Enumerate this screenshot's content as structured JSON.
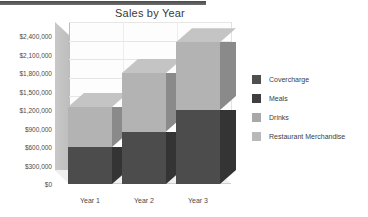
{
  "top_rule": {
    "color": "#5a5a5a"
  },
  "chart_data": {
    "type": "bar",
    "subtype": "stacked-3d-column",
    "title": "Sales by Year",
    "xlabel": "",
    "ylabel": "",
    "categories": [
      "Year 1",
      "Year 2",
      "Year 3"
    ],
    "series": [
      {
        "name": "Covercharge",
        "color": "#4f4f4f",
        "values": [
          0,
          0,
          0
        ]
      },
      {
        "name": "Meals",
        "color": "#3f3f3f",
        "values": [
          600000,
          850000,
          1200000
        ]
      },
      {
        "name": "Drinks",
        "color": "#a8a8a8",
        "values": [
          650000,
          950000,
          1100000
        ]
      },
      {
        "name": "Restaurant Merchandise",
        "color": "#b9b9b9",
        "values": [
          0,
          0,
          0
        ]
      }
    ],
    "totals": [
      1250000,
      1800000,
      2300000
    ],
    "ylim": [
      0,
      2400000
    ],
    "ytick_values": [
      0,
      300000,
      600000,
      900000,
      1200000,
      1500000,
      1800000,
      2100000,
      2400000
    ],
    "ytick_labels": [
      "$0",
      "$300,000",
      "$600,000",
      "$900,000",
      "$1,200,000",
      "$1,500,000",
      "$1,800,000",
      "$2,100,000",
      "$2,400,000"
    ],
    "grid": true,
    "legend_position": "right"
  },
  "legend": {
    "items": [
      {
        "label": "Covercharge",
        "swatch": "sw-cover"
      },
      {
        "label": "Meals",
        "swatch": "sw-meals"
      },
      {
        "label": "Drinks",
        "swatch": "sw-drinks"
      },
      {
        "label": "Restaurant Merchandise",
        "swatch": "sw-merch"
      }
    ]
  }
}
